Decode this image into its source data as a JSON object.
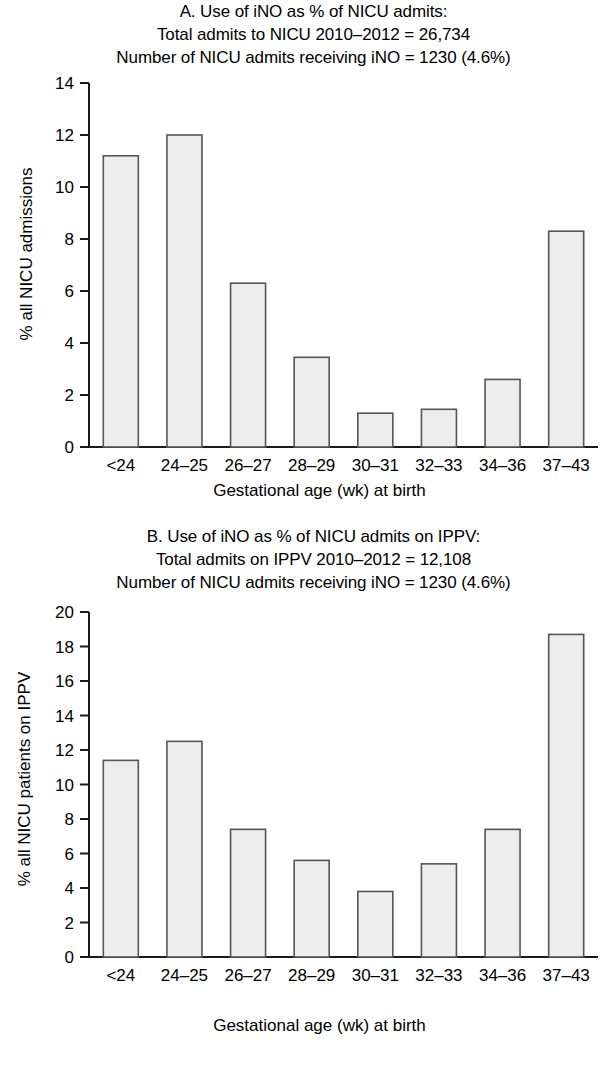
{
  "figure": {
    "xaxis_title": "Gestational age (wk) at birth",
    "categories": [
      "<24",
      "24–25",
      "26–27",
      "28–29",
      "30–31",
      "32–33",
      "34–36",
      "37–43"
    ],
    "bar_fill": "#ededed",
    "bar_stroke": "#555555",
    "axis_color": "#1a1a1a"
  },
  "panel_a": {
    "title_line1": "A. Use of iNO as % of NICU admits:",
    "title_line2": "Total admits to NICU 2010–2012 = 26,734",
    "title_line3": "Number of NICU admits receiving iNO = 1230 (4.6%)",
    "ylabel": "% all NICU admissions",
    "yticks": [
      "0",
      "2",
      "4",
      "6",
      "8",
      "10",
      "12",
      "14"
    ],
    "xaxis_title": "Gestational age (wk) at birth"
  },
  "panel_b": {
    "title_line1": "B. Use of iNO as % of NICU admits on IPPV:",
    "title_line2": "Total admits on IPPV 2010–2012 = 12,108",
    "title_line3": "Number of NICU admits receiving iNO = 1230 (4.6%)",
    "ylabel": "% all NICU patients on IPPV",
    "yticks": [
      "0",
      "2",
      "4",
      "6",
      "8",
      "10",
      "12",
      "14",
      "16",
      "18",
      "20"
    ],
    "xaxis_title": "Gestational age (wk) at birth"
  },
  "chart_data": [
    {
      "type": "bar",
      "panel": "A",
      "title": "A. Use of iNO as % of NICU admits: Total admits to NICU 2010–2012 = 26,734; Number of NICU admits receiving iNO = 1230 (4.6%)",
      "xlabel": "Gestational age (wk) at birth",
      "ylabel": "% all NICU admissions",
      "categories": [
        "<24",
        "24–25",
        "26–27",
        "28–29",
        "30–31",
        "32–33",
        "34–36",
        "37–43"
      ],
      "values": [
        11.2,
        12.0,
        6.3,
        3.45,
        1.3,
        1.45,
        2.6,
        8.3
      ],
      "ylim": [
        0,
        14
      ],
      "ytick_step": 2,
      "grid": false,
      "legend": "none"
    },
    {
      "type": "bar",
      "panel": "B",
      "title": "B. Use of iNO as % of NICU admits on IPPV: Total admits on IPPV 2010–2012 = 12,108; Number of NICU admits receiving iNO = 1230 (4.6%)",
      "xlabel": "Gestational age (wk) at birth",
      "ylabel": "% all NICU patients on IPPV",
      "categories": [
        "<24",
        "24–25",
        "26–27",
        "28–29",
        "30–31",
        "32–33",
        "34–36",
        "37–43"
      ],
      "values": [
        11.4,
        12.5,
        7.4,
        5.6,
        3.8,
        5.4,
        7.4,
        18.7
      ],
      "ylim": [
        0,
        20
      ],
      "ytick_step": 2,
      "grid": false,
      "legend": "none"
    }
  ]
}
